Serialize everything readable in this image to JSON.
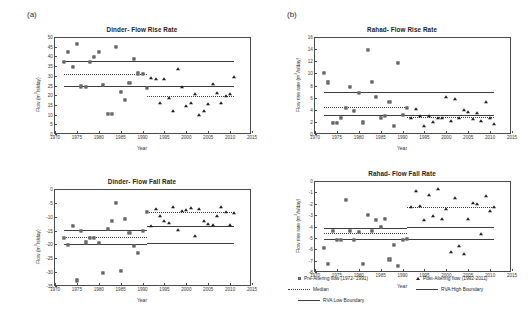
{
  "figure": {
    "panel_a_label": "(a)",
    "panel_b_label": "(b)"
  },
  "legend": {
    "pre_label": "Pre-Altering flow (1972- 1991)",
    "post_label": "Post-Altering flow (1992-2011)",
    "median_label": "Median",
    "rva_high_label": "RVA High Boundary",
    "rva_low_label": "RVA Low Boundary",
    "marker_pre": "square-marker",
    "marker_post": "triangle-marker",
    "line_median": "dotted-line",
    "line_rva": "solid-line"
  },
  "chart_data": [
    {
      "id": "dinder-flow-rise-rate",
      "type": "scatter",
      "title": "Dinder- Flow Rise Rate",
      "xlabel": "Year",
      "ylabel": "Flow (m³/s/day)",
      "xlim": [
        1970,
        2015
      ],
      "ylim": [
        0,
        50
      ],
      "xticks": [
        1970,
        1975,
        1980,
        1985,
        1990,
        1995,
        2000,
        2005,
        2010,
        2015
      ],
      "yticks": [
        0,
        5,
        10,
        15,
        20,
        25,
        30,
        35,
        40,
        45,
        50
      ],
      "grid": false,
      "series": [
        {
          "name": "Pre-Altering flow (1972- 1991)",
          "marker": "square",
          "x": [
            1972,
            1973,
            1974,
            1975,
            1976,
            1977,
            1978,
            1979,
            1980,
            1981,
            1982,
            1983,
            1984,
            1985,
            1986,
            1987,
            1988,
            1989,
            1990,
            1991
          ],
          "y": [
            37.3,
            42.2,
            34.6,
            46.5,
            24.5,
            24.3,
            37.2,
            39.9,
            42.5,
            25.5,
            10.5,
            10.2,
            44.8,
            21.5,
            17.6,
            26.3,
            38.5,
            31.2,
            30.8,
            23.8
          ]
        },
        {
          "name": "Post-Altering flow (1992-2011)",
          "marker": "triangle",
          "x": [
            1992,
            1993,
            1994,
            1995,
            1996,
            1997,
            1998,
            1999,
            2000,
            2001,
            2002,
            2003,
            2004,
            2005,
            2006,
            2007,
            2008,
            2009,
            2010,
            2011
          ],
          "y": [
            29.0,
            28.6,
            16.2,
            28.2,
            18.5,
            11.8,
            33.6,
            24.4,
            14.5,
            16.0,
            20.6,
            10.0,
            11.9,
            15.5,
            25.8,
            20.9,
            15.9,
            19.8,
            20.6,
            29.3
          ]
        }
      ],
      "reference_lines": {
        "pre": {
          "median": 31.0,
          "rva_high": 37.5,
          "rva_low": 24.5,
          "x_start": 1972,
          "x_end": 1991
        },
        "post": {
          "median": 19.8,
          "rva_high": 37.5,
          "rva_low": 24.5,
          "x_start": 1991,
          "x_end": 2011
        }
      }
    },
    {
      "id": "dinder-flow-fall-rate",
      "type": "scatter",
      "title": "Dinder- Flow Fall Rate",
      "xlabel": "Year",
      "ylabel": "Flow (m³/s/day)",
      "xlim": [
        1970,
        2015
      ],
      "ylim": [
        -35,
        0
      ],
      "xticks": [
        1970,
        1975,
        1980,
        1985,
        1990,
        1995,
        2000,
        2005,
        2010,
        2015
      ],
      "yticks": [
        0,
        -5,
        -10,
        -15,
        -20,
        -25,
        -30,
        -35
      ],
      "grid": false,
      "series": [
        {
          "name": "Pre-Altering flow (1972- 1991)",
          "marker": "square",
          "x": [
            1972,
            1973,
            1974,
            1975,
            1976,
            1977,
            1978,
            1979,
            1980,
            1981,
            1982,
            1983,
            1984,
            1985,
            1986,
            1987,
            1988,
            1989,
            1990,
            1991
          ],
          "y": [
            -17.5,
            -20.3,
            -13.4,
            -33.0,
            -15.0,
            -19.3,
            -17.7,
            -17.5,
            -19.5,
            -30.4,
            -14.3,
            -11.5,
            -5.1,
            -29.6,
            -10.8,
            -16.0,
            -20.5,
            -23.0,
            -15.0,
            -8.3
          ]
        },
        {
          "name": "Post-Altering flow (1992-2011)",
          "marker": "triangle",
          "x": [
            1992,
            1993,
            1994,
            1995,
            1996,
            1997,
            1998,
            1999,
            2000,
            2001,
            2002,
            2003,
            2004,
            2005,
            2006,
            2007,
            2008,
            2009,
            2010,
            2011
          ],
          "y": [
            -13.3,
            -7.3,
            -9.8,
            -11.5,
            -12.2,
            -6.5,
            -14.7,
            -8.0,
            -7.5,
            -7.0,
            -16.8,
            -7.3,
            -11.5,
            -12.8,
            -13.0,
            -9.8,
            -6.4,
            -8.2,
            -13.0,
            -8.5
          ]
        }
      ],
      "reference_lines": {
        "pre": {
          "median": -17.3,
          "rva_high": -14.8,
          "rva_low": -20.0,
          "x_start": 1972,
          "x_end": 1991
        },
        "post": {
          "median": -8.3,
          "rva_high": -13.2,
          "rva_low": -19.5,
          "x_start": 1991,
          "x_end": 2011
        }
      }
    },
    {
      "id": "rahad-flow-rise-rate",
      "type": "scatter",
      "title": "Rahad- Flow Rise Rate",
      "xlabel": "Year",
      "ylabel": "Flow rise rate (m³/s/day)",
      "xlim": [
        1970,
        2015
      ],
      "ylim": [
        0,
        16
      ],
      "xticks": [
        1970,
        1975,
        1980,
        1985,
        1990,
        1995,
        2000,
        2005,
        2010,
        2015
      ],
      "yticks": [
        0,
        2,
        4,
        6,
        8,
        10,
        12,
        14,
        16
      ],
      "grid": false,
      "series": [
        {
          "name": "Pre-Altering flow (1972- 1991)",
          "marker": "square",
          "x": [
            1972,
            1973,
            1974,
            1975,
            1976,
            1977,
            1978,
            1979,
            1980,
            1981,
            1982,
            1983,
            1984,
            1985,
            1986,
            1987,
            1988,
            1989,
            1990,
            1991
          ],
          "y": [
            10.1,
            8.5,
            1.8,
            1.8,
            2.6,
            4.3,
            7.7,
            3.8,
            6.8,
            1.9,
            13.8,
            8.6,
            6.1,
            2.7,
            3.0,
            5.3,
            1.4,
            11.7,
            3.1,
            4.3
          ]
        },
        {
          "name": "Post-Altering flow (1992-2011)",
          "marker": "triangle",
          "x": [
            1992,
            1993,
            1994,
            1995,
            1996,
            1997,
            1998,
            1999,
            2000,
            2001,
            2002,
            2003,
            2004,
            2005,
            2006,
            2007,
            2008,
            2009,
            2010,
            2011
          ],
          "y": [
            2.6,
            4.1,
            3.0,
            1.4,
            3.0,
            1.9,
            2.6,
            2.6,
            6.1,
            2.1,
            5.8,
            2.6,
            4.0,
            3.6,
            2.5,
            3.5,
            2.1,
            5.2,
            2.7,
            1.6
          ]
        }
      ],
      "reference_lines": {
        "pre": {
          "median": 4.4,
          "rva_high": 7.0,
          "rva_low": 3.2,
          "x_start": 1972,
          "x_end": 1991
        },
        "post": {
          "median": 2.8,
          "rva_high": 7.0,
          "rva_low": 3.2,
          "x_start": 1991,
          "x_end": 2011
        }
      }
    },
    {
      "id": "rahad-flow-fall-rate",
      "type": "scatter",
      "title": "Rahad- Flow Fall Rate",
      "xlabel": "Year",
      "ylabel": "Flow rise rate (m³/s/day)",
      "xlim": [
        1970,
        2015
      ],
      "ylim": [
        -8,
        0
      ],
      "xticks": [
        1970,
        1975,
        1980,
        1985,
        1990,
        1995,
        2000,
        2005,
        2010,
        2015
      ],
      "yticks": [
        0,
        -1,
        -2,
        -3,
        -4,
        -5,
        -6,
        -7,
        -8
      ],
      "grid": false,
      "series": [
        {
          "name": "Pre-Altering flow (1972- 1991)",
          "marker": "square",
          "x": [
            1972,
            1973,
            1974,
            1975,
            1976,
            1977,
            1978,
            1979,
            1980,
            1981,
            1982,
            1983,
            1984,
            1985,
            1986,
            1987,
            1988,
            1989,
            1990,
            1991
          ],
          "y": [
            -5.9,
            -7.3,
            -4.4,
            -5.2,
            -5.2,
            -1.7,
            -4.4,
            -5.2,
            -4.5,
            -7.3,
            -3.0,
            -4.4,
            -3.4,
            -4.0,
            -3.3,
            -6.9,
            -5.6,
            -7.5,
            -5.2,
            -5.1
          ]
        },
        {
          "name": "Post-Altering flow (1992-2011)",
          "marker": "triangle",
          "x": [
            1992,
            1993,
            1994,
            1995,
            1996,
            1997,
            1998,
            1999,
            2000,
            2001,
            2002,
            2003,
            2004,
            2005,
            2006,
            2007,
            2008,
            2009,
            2010,
            2011
          ],
          "y": [
            -2.3,
            -0.9,
            -2.2,
            -3.4,
            -1.2,
            -3.1,
            -0.7,
            -3.3,
            -2.5,
            -6.2,
            -1.5,
            -5.7,
            -6.4,
            -3.3,
            -1.9,
            -2.0,
            -4.7,
            -1.3,
            -2.6,
            -2.3
          ]
        }
      ],
      "reference_lines": {
        "pre": {
          "median": -4.6,
          "rva_high": -4.1,
          "rva_low": -5.1,
          "x_start": 1972,
          "x_end": 1991
        },
        "post": {
          "median": -2.3,
          "rva_high": -4.0,
          "rva_low": -5.1,
          "x_start": 1991,
          "x_end": 2011
        }
      }
    }
  ]
}
